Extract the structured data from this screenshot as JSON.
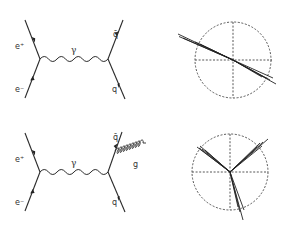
{
  "figure": {
    "top": {
      "feynman": {
        "labels": {
          "positron": "e⁺",
          "electron": "e⁻",
          "photon": "γ",
          "antiquark": "q̄",
          "quark": "q"
        }
      },
      "event_display": {
        "description": "two-jet event",
        "jets": 2
      }
    },
    "bottom": {
      "feynman": {
        "labels": {
          "positron": "e⁺",
          "electron": "e⁻",
          "photon": "γ",
          "antiquark": "q̄",
          "quark": "q",
          "gluon": "g"
        }
      },
      "event_display": {
        "description": "three-jet event",
        "jets": 3
      }
    }
  }
}
